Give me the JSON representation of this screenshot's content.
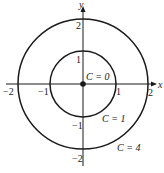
{
  "diagram": {
    "type": "level-curves",
    "axes": {
      "x_label": "x",
      "y_label": "y",
      "x_ticks": [
        {
          "value": -2,
          "label": "−2"
        },
        {
          "value": -1,
          "label": "−1"
        },
        {
          "value": 1,
          "label": "1"
        },
        {
          "value": 2,
          "label": "2"
        }
      ],
      "y_ticks": [
        {
          "value": 2,
          "label": "2"
        },
        {
          "value": 1,
          "label": "1"
        },
        {
          "value": -1,
          "label": "−1"
        },
        {
          "value": -2,
          "label": "−2"
        }
      ]
    },
    "curves": [
      {
        "label": "C = 0",
        "radius": 0,
        "kind": "point"
      },
      {
        "label": "C = 1",
        "radius": 1,
        "kind": "circle"
      },
      {
        "label": "C = 4",
        "radius": 2,
        "kind": "circle"
      }
    ],
    "colors": {
      "stroke": "#1a1a1a",
      "background": "#ffffff"
    }
  }
}
